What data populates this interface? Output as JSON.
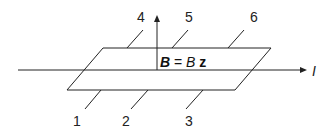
{
  "diagram": {
    "type": "Hall bar sample with contacts in magnetic field",
    "field_label": {
      "bold_symbol": "B",
      "equals": " = ",
      "magnitude": "B",
      "unit_vector": "z"
    },
    "current_label": "I",
    "contacts": [
      {
        "id": "1",
        "label": "1"
      },
      {
        "id": "2",
        "label": "2"
      },
      {
        "id": "3",
        "label": "3"
      },
      {
        "id": "4",
        "label": "4"
      },
      {
        "id": "5",
        "label": "5"
      },
      {
        "id": "6",
        "label": "6"
      }
    ],
    "colors": {
      "line": "#222222",
      "background": "#ffffff"
    }
  }
}
